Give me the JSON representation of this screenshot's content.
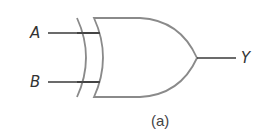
{
  "diagram": {
    "type": "logic-gate",
    "gate": "XOR",
    "inputs": [
      {
        "label": "A"
      },
      {
        "label": "B"
      }
    ],
    "output": {
      "label": "Y"
    },
    "caption": "(a)",
    "colors": {
      "gate_stroke": "#8a8a8a",
      "wire_stroke": "#3a3a3a",
      "text": "#333333",
      "background": "#ffffff"
    }
  }
}
